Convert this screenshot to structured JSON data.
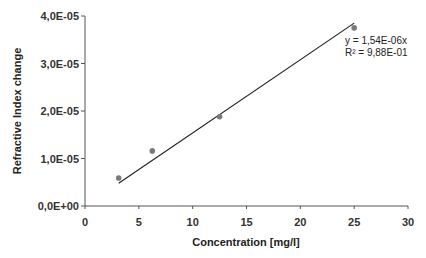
{
  "chart_data": {
    "type": "scatter",
    "title": "",
    "xlabel": "Concentration [mg/l]",
    "ylabel": "Refractive Index change",
    "xlim": [
      0,
      30
    ],
    "ylim": [
      0,
      4e-05
    ],
    "x_ticks": [
      0,
      5,
      10,
      15,
      20,
      25,
      30
    ],
    "x_tick_labels": [
      "0",
      "5",
      "10",
      "15",
      "20",
      "25",
      "30"
    ],
    "y_ticks": [
      0,
      1e-05,
      2e-05,
      3e-05,
      4e-05
    ],
    "y_tick_labels": [
      "0,0E+00",
      "1,0E-05",
      "2,0E-05",
      "3,0E-05",
      "4,0E-05"
    ],
    "grid": false,
    "legend": null,
    "series": [
      {
        "name": "Measured",
        "x": [
          3.125,
          6.25,
          12.5,
          25
        ],
        "y": [
          5.9e-06,
          1.16e-05,
          1.88e-05,
          3.75e-05
        ],
        "marker_color": "#7a7a7a"
      }
    ],
    "trendline": {
      "type": "linear-through-origin",
      "slope": 1.54e-06,
      "x_range": [
        3.125,
        25
      ],
      "color": "#222222",
      "equation_label": "y = 1,54E-06x",
      "r2_label": "R² = 9,88E-01"
    }
  },
  "colors": {
    "axis": "#555555",
    "marker": "#7a7a7a",
    "trendline": "#222222"
  }
}
